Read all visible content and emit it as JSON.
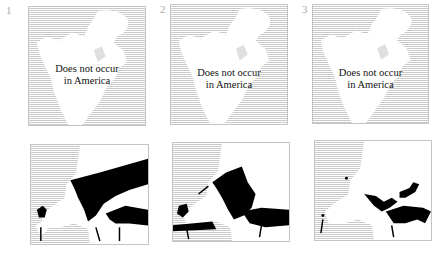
{
  "panels": [
    {
      "number": "1",
      "america_caption": [
        "Does not occur",
        "in America"
      ]
    },
    {
      "number": "2",
      "america_caption": [
        "Does not occur",
        "in America"
      ]
    },
    {
      "number": "3",
      "america_caption": [
        "Does not occur",
        "in America"
      ]
    }
  ],
  "colors": {
    "hatch": "#c9c9c9",
    "land": "#ffffff",
    "range": "#000000",
    "label": "#aaaaaa"
  }
}
